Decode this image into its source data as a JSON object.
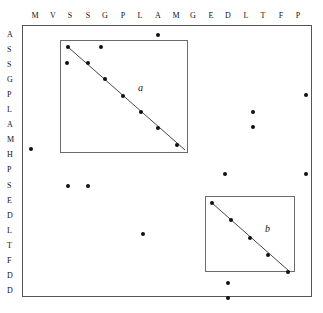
{
  "figure": {
    "type": "dot-matrix-plot",
    "title": "",
    "frame": {
      "x": 22,
      "y": 25,
      "width": 290,
      "height": 272
    }
  },
  "axes": {
    "x_labels": [
      "M",
      "V",
      "S",
      "S",
      "G",
      "P",
      "L",
      "A",
      "M",
      "G",
      "E",
      "D",
      "L",
      "T",
      "F",
      "P"
    ],
    "y_labels": [
      "A",
      "S",
      "S",
      "G",
      "P",
      "L",
      "A",
      "M",
      "H",
      "P",
      "S",
      "E",
      "D",
      "L",
      "T",
      "F",
      "D",
      "D"
    ],
    "x_positions": [
      35,
      53,
      70,
      88,
      105,
      123,
      140,
      158,
      176,
      193,
      211,
      228,
      246,
      263,
      281,
      298
    ],
    "y_positions": [
      35,
      50,
      65,
      80,
      95,
      110,
      125,
      140,
      155,
      170,
      186,
      201,
      216,
      231,
      246,
      261,
      276,
      291
    ]
  },
  "chart_data": {
    "type": "scatter",
    "title": "",
    "xlabel": "",
    "ylabel": "",
    "x_categories": [
      "M",
      "V",
      "S",
      "S",
      "G",
      "P",
      "L",
      "A",
      "M",
      "G",
      "E",
      "D",
      "L",
      "T",
      "F",
      "P"
    ],
    "y_categories": [
      "A",
      "S",
      "S",
      "G",
      "P",
      "L",
      "A",
      "M",
      "H",
      "P",
      "S",
      "E",
      "D",
      "L",
      "T",
      "F",
      "D",
      "D"
    ],
    "grid": false,
    "legend": "none",
    "points": [
      {
        "x": 158,
        "y": 35,
        "col": "A",
        "row": "A",
        "group": "outside"
      },
      {
        "x": 68,
        "y": 47,
        "col": "S",
        "row": "S",
        "group": "a"
      },
      {
        "x": 101,
        "y": 47,
        "col": "G",
        "row": "S",
        "group": "a"
      },
      {
        "x": 67,
        "y": 63,
        "col": "S",
        "row": "S",
        "group": "outside"
      },
      {
        "x": 88,
        "y": 63,
        "col": "S",
        "row": "S",
        "group": "a"
      },
      {
        "x": 105,
        "y": 79,
        "col": "G",
        "row": "G",
        "group": "a"
      },
      {
        "x": 123,
        "y": 96,
        "col": "P",
        "row": "P",
        "group": "a"
      },
      {
        "x": 141,
        "y": 112,
        "col": "L",
        "row": "L",
        "group": "a"
      },
      {
        "x": 158,
        "y": 128,
        "col": "A",
        "row": "A",
        "group": "a"
      },
      {
        "x": 177,
        "y": 145,
        "col": "M",
        "row": "M",
        "group": "a"
      },
      {
        "x": 306,
        "y": 95,
        "col": "P",
        "row": "P",
        "group": "outside"
      },
      {
        "x": 253,
        "y": 112,
        "col": "L",
        "row": "L",
        "group": "outside"
      },
      {
        "x": 253,
        "y": 127,
        "col": "L",
        "row": "A",
        "group": "outside"
      },
      {
        "x": 31,
        "y": 149,
        "col": "M",
        "row": "M",
        "group": "outside"
      },
      {
        "x": 225,
        "y": 174,
        "col": "E",
        "row": "P",
        "group": "outside"
      },
      {
        "x": 306,
        "y": 174,
        "col": "P",
        "row": "P",
        "group": "outside"
      },
      {
        "x": 68,
        "y": 186,
        "col": "S",
        "row": "S",
        "group": "outside"
      },
      {
        "x": 88,
        "y": 186,
        "col": "S",
        "row": "S",
        "group": "outside"
      },
      {
        "x": 212,
        "y": 203,
        "col": "E",
        "row": "E",
        "group": "b"
      },
      {
        "x": 231,
        "y": 220,
        "col": "D",
        "row": "D",
        "group": "b"
      },
      {
        "x": 143,
        "y": 234,
        "col": "L",
        "row": "L",
        "group": "outside"
      },
      {
        "x": 250,
        "y": 238,
        "col": "L",
        "row": "L",
        "group": "b"
      },
      {
        "x": 268,
        "y": 255,
        "col": "T",
        "row": "T",
        "group": "b"
      },
      {
        "x": 288,
        "y": 272,
        "col": "F",
        "row": "F",
        "group": "b"
      },
      {
        "x": 228,
        "y": 283,
        "col": "D",
        "row": "D",
        "group": "outside"
      },
      {
        "x": 228,
        "y": 298,
        "col": "D",
        "row": "D",
        "group": "outside"
      }
    ],
    "regions": [
      {
        "label": "a",
        "x": 60,
        "y": 40,
        "width": 128,
        "height": 113,
        "label_x": 138,
        "label_y": 82,
        "diagonal": {
          "x1": 68,
          "y1": 47,
          "x2": 185,
          "y2": 150
        }
      },
      {
        "label": "b",
        "x": 205,
        "y": 196,
        "width": 90,
        "height": 76,
        "label_x": 265,
        "label_y": 223,
        "diagonal": {
          "x1": 212,
          "y1": 203,
          "x2": 289,
          "y2": 271
        }
      }
    ]
  },
  "colors": {
    "dot": "#111111",
    "frame": "#555555",
    "region_border": "#6b6b6b",
    "diagonal": "#333333",
    "background": "#ffffff",
    "text": "#111111"
  }
}
